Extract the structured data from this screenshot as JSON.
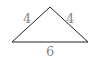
{
  "diagram": {
    "shape": "isosceles triangle",
    "vertices": {
      "apex": [
        50,
        7
      ],
      "left": [
        12,
        42
      ],
      "right": [
        88,
        42
      ]
    },
    "sides": {
      "left": "4",
      "right": "4",
      "base": "6"
    },
    "line_color": "#222222",
    "label_color": "#888888"
  }
}
